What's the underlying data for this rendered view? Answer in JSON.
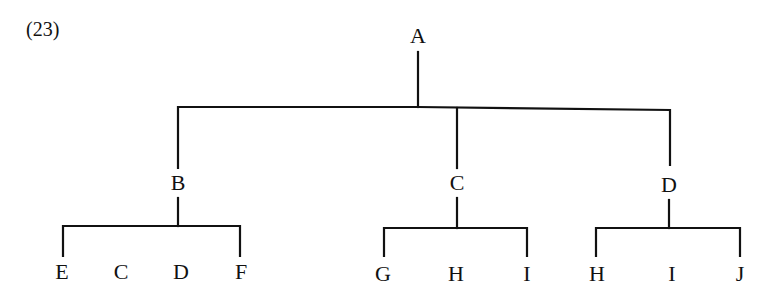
{
  "example_number": "(23)",
  "line_color": "#111111",
  "tree": {
    "root": {
      "label": "A",
      "x": 418,
      "y": 36
    },
    "level1": [
      {
        "label": "B",
        "x": 178,
        "y": 183
      },
      {
        "label": "C",
        "x": 457,
        "y": 183
      },
      {
        "label": "D",
        "x": 669,
        "y": 185
      }
    ],
    "leaves": [
      {
        "label": "E",
        "x": 62,
        "y": 272,
        "parent": "B"
      },
      {
        "label": "C",
        "x": 121,
        "y": 272,
        "parent": "B"
      },
      {
        "label": "D",
        "x": 181,
        "y": 272,
        "parent": "B"
      },
      {
        "label": "F",
        "x": 241,
        "y": 272,
        "parent": "B"
      },
      {
        "label": "G",
        "x": 383,
        "y": 274,
        "parent": "C"
      },
      {
        "label": "H",
        "x": 456,
        "y": 274,
        "parent": "C"
      },
      {
        "label": "I",
        "x": 527,
        "y": 274,
        "parent": "C"
      },
      {
        "label": "H",
        "x": 597,
        "y": 274,
        "parent": "D"
      },
      {
        "label": "I",
        "x": 672,
        "y": 274,
        "parent": "D"
      },
      {
        "label": "J",
        "x": 740,
        "y": 274,
        "parent": "D"
      }
    ]
  }
}
